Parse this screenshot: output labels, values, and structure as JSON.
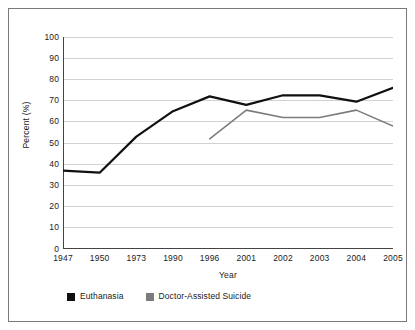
{
  "chart_data": {
    "type": "line",
    "title": "",
    "subtitle": "",
    "xlabel": "Year",
    "ylabel": "Percent (%)",
    "categories": [
      "1947",
      "1950",
      "1973",
      "1990",
      "1996",
      "2001",
      "2002",
      "2003",
      "2004",
      "2005"
    ],
    "ylim": [
      0,
      100
    ],
    "yticks": [
      "0",
      "10",
      "20",
      "30",
      "40",
      "50",
      "60",
      "70",
      "80",
      "90",
      "100"
    ],
    "grid": "horizontal",
    "legend_position": "bottom-left",
    "series": [
      {
        "name": "Euthanasia",
        "color": "#111111",
        "values": [
          37,
          36,
          53,
          65,
          72,
          68,
          72.5,
          72.5,
          69.5,
          76
        ]
      },
      {
        "name": "Doctor-Assisted Suicide",
        "color": "#7c7c7c",
        "values": [
          null,
          null,
          null,
          null,
          52,
          65.5,
          62,
          62,
          65.5,
          58
        ]
      }
    ]
  },
  "axis": {
    "ylabel": "Percent (%)",
    "xlabel": "Year"
  },
  "legend": {
    "items": [
      {
        "label": "Euthanasia",
        "color": "#111111"
      },
      {
        "label": "Doctor-Assisted Suicide",
        "color": "#7c7c7c"
      }
    ]
  },
  "colors": {
    "frame_border": "#7a7a7a",
    "axis_line": "#444444",
    "grid_line": "#d2d2d2",
    "background": "#ffffff",
    "euthanasia": "#111111",
    "doctor_assisted_suicide": "#7c7c7c"
  }
}
